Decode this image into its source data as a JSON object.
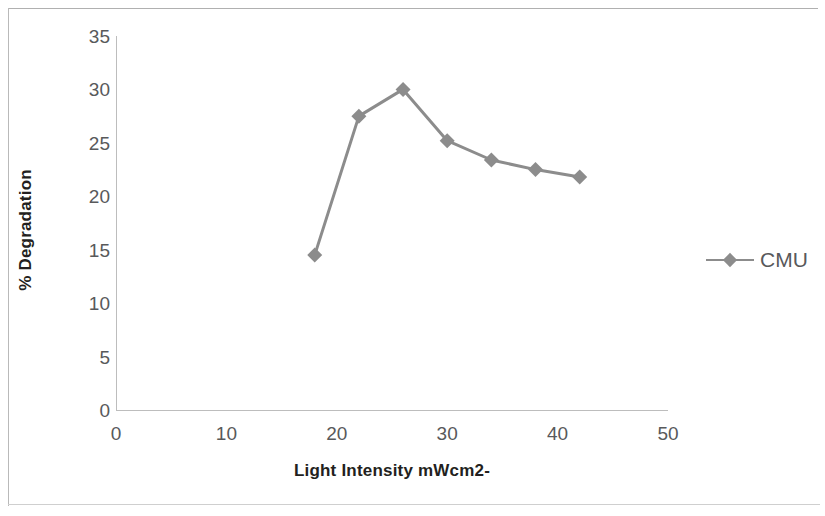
{
  "chart_data": {
    "type": "line",
    "title": "",
    "xlabel": "Light Intensity mWcm2-",
    "ylabel": "% Degradation",
    "xlim": [
      0,
      50
    ],
    "ylim": [
      0,
      35
    ],
    "xticks": [
      0,
      10,
      20,
      30,
      40,
      50
    ],
    "yticks": [
      0,
      5,
      10,
      15,
      20,
      25,
      30,
      35
    ],
    "xtick_labels": [
      "0",
      "10",
      "20",
      "30",
      "40",
      "50"
    ],
    "ytick_labels": [
      "0",
      "5",
      "10",
      "15",
      "20",
      "25",
      "30",
      "35"
    ],
    "grid": false,
    "legend_position": "right",
    "marker": "diamond",
    "series": [
      {
        "name": "CMU",
        "color": "#8c8c8c",
        "x": [
          18,
          22,
          26,
          30,
          34,
          38,
          42
        ],
        "values": [
          14.5,
          27.5,
          30.0,
          25.2,
          23.4,
          22.5,
          21.8
        ]
      }
    ]
  },
  "legend": {
    "entries": [
      {
        "label": "CMU",
        "color": "#8c8c8c"
      }
    ]
  },
  "axes": {
    "x_title": "Light Intensity mWcm2-",
    "y_title": "% Degradation"
  }
}
